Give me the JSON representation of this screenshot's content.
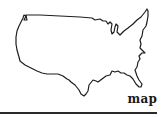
{
  "figure": {
    "label": "map",
    "colors": {
      "outline": "#1e1e1e",
      "fill": "#ffffff",
      "label": "#1a1a1a",
      "rule": "#2a2a2a",
      "background": "#ffffff"
    }
  }
}
